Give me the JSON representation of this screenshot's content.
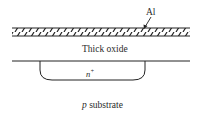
{
  "diagram": {
    "labels": {
      "metal": "Al",
      "oxide": "Thick oxide",
      "diffusion": "n",
      "diffusion_sup": "+",
      "substrate_prefix": "p",
      "substrate": " substrate"
    },
    "layers": [
      {
        "name": "Al",
        "type": "hatched-metal-strip"
      },
      {
        "name": "Thick oxide",
        "type": "oxide-region"
      },
      {
        "name": "n+",
        "type": "diffusion-well"
      },
      {
        "name": "p substrate",
        "type": "substrate"
      }
    ],
    "colors": {
      "line": "#222222",
      "background": "#ffffff"
    }
  }
}
